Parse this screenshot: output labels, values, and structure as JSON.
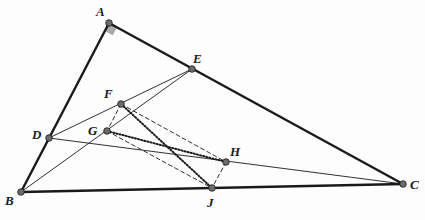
{
  "diagram": {
    "type": "geometry-figure",
    "colors": {
      "stroke": "#1a1a1a",
      "point_fill": "#6b6b6b",
      "right_angle_fill": "#a8a8a8"
    },
    "points": {
      "A": {
        "label": "A",
        "x": 109,
        "y": 23
      },
      "B": {
        "label": "B",
        "x": 21,
        "y": 192
      },
      "C": {
        "label": "C",
        "x": 403,
        "y": 184
      },
      "D": {
        "label": "D",
        "x": 49,
        "y": 138
      },
      "E": {
        "label": "E",
        "x": 192,
        "y": 69
      },
      "F": {
        "label": "F",
        "x": 121,
        "y": 104
      },
      "G": {
        "label": "G",
        "x": 107,
        "y": 131
      },
      "H": {
        "label": "H",
        "x": 226,
        "y": 162
      },
      "J": {
        "label": "J",
        "x": 212,
        "y": 188
      }
    },
    "labels": [
      {
        "id": "A",
        "text": "A",
        "x": 96,
        "y": 5
      },
      {
        "id": "E",
        "text": "E",
        "x": 193,
        "y": 52
      },
      {
        "id": "F",
        "text": "F",
        "x": 104,
        "y": 87
      },
      {
        "id": "G",
        "text": "G",
        "x": 88,
        "y": 124
      },
      {
        "id": "D",
        "text": "D",
        "x": 32,
        "y": 128
      },
      {
        "id": "B",
        "text": "B",
        "x": 5,
        "y": 194
      },
      {
        "id": "H",
        "text": "H",
        "x": 230,
        "y": 145
      },
      {
        "id": "J",
        "text": "J",
        "x": 207,
        "y": 196
      },
      {
        "id": "C",
        "text": "C",
        "x": 410,
        "y": 178
      }
    ],
    "segments": {
      "thick": [
        [
          "A",
          "B"
        ],
        [
          "A",
          "C"
        ],
        [
          "B",
          "C"
        ]
      ],
      "thin": [
        [
          "E",
          "D"
        ],
        [
          "E",
          "B"
        ],
        [
          "D",
          "C"
        ]
      ],
      "dashed": [
        [
          "F",
          "G"
        ],
        [
          "F",
          "H"
        ],
        [
          "G",
          "J"
        ],
        [
          "H",
          "J"
        ]
      ],
      "dotted": [
        [
          "F",
          "J"
        ],
        [
          "G",
          "H"
        ]
      ]
    },
    "right_angle_at": "A"
  }
}
